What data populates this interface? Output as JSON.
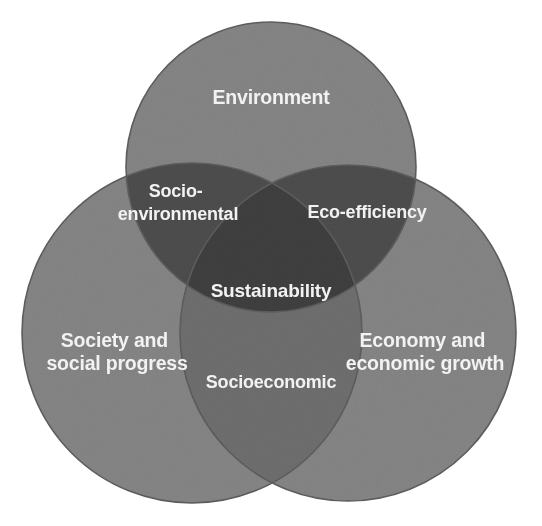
{
  "diagram": {
    "type": "venn-3-circle",
    "canvas": {
      "width": 542,
      "height": 526,
      "background": "#ffffff"
    },
    "palette": {
      "circle_fill": "#808080",
      "overlap_two_upper": "#4a4a4a",
      "overlap_two_lower": "#6a6a6a",
      "overlap_three": "#3d3d3d",
      "outline": "#5a5a5a",
      "label_text": "#f2f2f2"
    },
    "circles": [
      {
        "id": "environment",
        "label": "Environment",
        "cx": 271,
        "cy": 167,
        "r": 145,
        "label_x": 271,
        "label_y": 99
      },
      {
        "id": "society",
        "label_line1": "Society and",
        "label_line2": "social progress",
        "cx": 192,
        "cy": 333,
        "r": 170,
        "label_x": 117,
        "label_y": 353
      },
      {
        "id": "economy",
        "label_line1": "Economy and",
        "label_line2": "economic growth",
        "cx": 348,
        "cy": 333,
        "r": 168,
        "label_x": 425,
        "label_y": 353
      }
    ],
    "intersections": [
      {
        "id": "socio-environmental",
        "label_line1": "Socio-",
        "label_line2": "environmental",
        "members": [
          "environment",
          "society"
        ],
        "label_x": 178,
        "label_y": 203
      },
      {
        "id": "eco-efficiency",
        "label": "Eco-efficiency",
        "members": [
          "environment",
          "economy"
        ],
        "label_x": 367,
        "label_y": 213
      },
      {
        "id": "socioeconomic",
        "label": "Socioeconomic",
        "members": [
          "society",
          "economy"
        ],
        "label_x": 271,
        "label_y": 383
      },
      {
        "id": "sustainability",
        "label": "Sustainability",
        "members": [
          "environment",
          "society",
          "economy"
        ],
        "label_x": 271,
        "label_y": 292
      }
    ]
  }
}
